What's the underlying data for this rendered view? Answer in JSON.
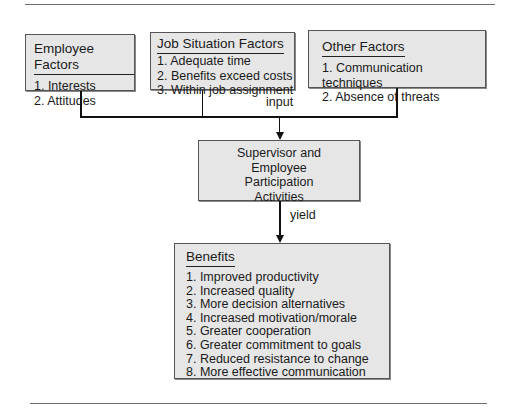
{
  "employee_factors": {
    "title": "Employee Factors",
    "items": [
      "1.  Interests",
      "2.  Attitudes"
    ]
  },
  "job_situation_factors": {
    "title": "Job Situation Factors",
    "items": [
      "1.  Adequate time",
      "2.  Benefits exceed costs",
      "3.  Within job assignment"
    ]
  },
  "other_factors": {
    "title": "Other Factors",
    "items": [
      "1.  Communication techniques",
      "2.  Absence of threats"
    ]
  },
  "connector_labels": {
    "input": "input",
    "yield": "yield"
  },
  "participation": {
    "lines": [
      "Supervisor and",
      "Employee",
      "Participation",
      "Activities"
    ]
  },
  "benefits": {
    "title": "Benefits",
    "items": [
      "1.  Improved productivity",
      "2.  Increased quality",
      "3.  More decision alternatives",
      "4.  Increased motivation/morale",
      "5.  Greater cooperation",
      "6.  Greater commitment to goals",
      "7.  Reduced resistance to change",
      "8.  More effective communication"
    ]
  },
  "colors": {
    "box_fill": "#e6e6e6",
    "line": "#111111",
    "rule": "#6f6f6f"
  }
}
